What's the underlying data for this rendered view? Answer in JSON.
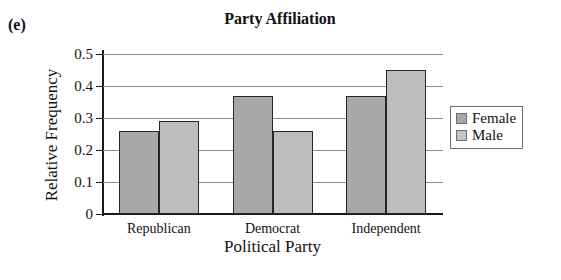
{
  "figure": {
    "panel_label": "(e)"
  },
  "chart_data": {
    "type": "bar",
    "title": "Party Affiliation",
    "xlabel": "Political Party",
    "ylabel": "Relative Frequency",
    "categories": [
      "Republican",
      "Democrat",
      "Independent"
    ],
    "series": [
      {
        "name": "Female",
        "values": [
          0.26,
          0.37,
          0.37
        ],
        "color": "#a8a8a8"
      },
      {
        "name": "Male",
        "values": [
          0.29,
          0.26,
          0.45
        ],
        "color": "#bdbdbd"
      }
    ],
    "ylim": [
      0,
      0.5
    ],
    "ytick_labels": [
      "0",
      "0.1",
      "0.2",
      "0.3",
      "0.4",
      "0.5"
    ],
    "ytick_values": [
      0,
      0.1,
      0.2,
      0.3,
      0.4,
      0.5
    ],
    "grid": true,
    "legend_position": "right",
    "legend_entries": [
      "Female",
      "Male"
    ]
  }
}
